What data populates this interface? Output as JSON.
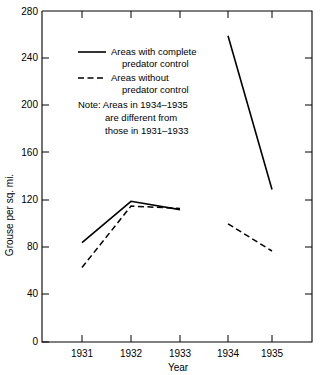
{
  "chart_data": {
    "type": "line",
    "title": "",
    "xlabel": "Year",
    "ylabel": "Grouse per sq. mi.",
    "x": [
      1931,
      1932,
      1933,
      1934,
      1935
    ],
    "xtick_labels": [
      "1931",
      "1932",
      "1933",
      "1934",
      "1935"
    ],
    "ytick_labels": [
      "0",
      "40",
      "80",
      "120",
      "160",
      "200",
      "240",
      "280"
    ],
    "yticks": [
      0,
      40,
      80,
      120,
      160,
      200,
      240,
      280
    ],
    "ylim": [
      0,
      280
    ],
    "xlim": [
      1930.5,
      1935.5
    ],
    "grid": false,
    "legend_position": "upper-left-inside",
    "series": [
      {
        "name": "Areas with complete predator control",
        "style": "solid",
        "color": "#000000",
        "segments": [
          {
            "x": [
              1931,
              1932,
              1933
            ],
            "values": [
              84,
              119,
              112
            ]
          },
          {
            "x": [
              1934,
              1935
            ],
            "values": [
              259,
              129
            ]
          }
        ]
      },
      {
        "name": "Areas without predator control",
        "style": "dashed",
        "color": "#000000",
        "segments": [
          {
            "x": [
              1931,
              1932,
              1933
            ],
            "values": [
              63,
              115,
              113
            ]
          },
          {
            "x": [
              1934,
              1935
            ],
            "values": [
              100,
              77
            ]
          }
        ]
      }
    ],
    "legend": [
      {
        "label_line1": "Areas with complete",
        "label_line2": "predator control",
        "style": "solid"
      },
      {
        "label_line1": "Areas without",
        "label_line2": "predator control",
        "style": "dashed"
      }
    ],
    "annotations": [
      {
        "name": "note",
        "lines": [
          "Note: Areas in 1934–1935",
          "are different from",
          "those in 1931–1933"
        ]
      }
    ]
  },
  "axes": {
    "y_title": "Grouse per sq. mi.",
    "x_title": "Year"
  },
  "note": {
    "line1": "Note: Areas in 1934–1935",
    "line2": "are different from",
    "line3": "those in 1931–1933"
  },
  "legend": {
    "solid_line1": "Areas with complete",
    "solid_line2": "predator control",
    "dashed_line1": "Areas without",
    "dashed_line2": "predator control"
  },
  "yticks": {
    "t0": "0",
    "t40": "40",
    "t80": "80",
    "t120": "120",
    "t160": "160",
    "t200": "200",
    "t240": "240",
    "t280": "280"
  },
  "xticks": {
    "t1931": "1931",
    "t1932": "1932",
    "t1933": "1933",
    "t1934": "1934",
    "t1935": "1935"
  }
}
